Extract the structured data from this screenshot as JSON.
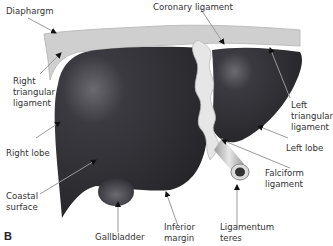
{
  "figure": {
    "panel_letter": "B",
    "colors": {
      "liver": "#2f2f34",
      "liver_highlight": "#5a5a60",
      "ligament": "#d9d9d9",
      "ligament_light": "#f0f0f0",
      "diaphragm": "#c4c4c4",
      "gallbladder": "#4a4a50",
      "arrow": "#999999",
      "arrowhead": "#111111",
      "text": "#333333"
    },
    "labels": [
      {
        "id": "diaphragm",
        "text": "Diaphargm"
      },
      {
        "id": "coronary-ligament",
        "text": "Coronary ligament"
      },
      {
        "id": "right-triangular-ligament",
        "text": "Right\ntriangular\nligament"
      },
      {
        "id": "left-triangular-ligament",
        "text": "Left\ntriangular\nligament"
      },
      {
        "id": "right-lobe",
        "text": "Right lobe"
      },
      {
        "id": "left-lobe",
        "text": "Left lobe"
      },
      {
        "id": "falciform-ligament",
        "text": "Falciform\nligament"
      },
      {
        "id": "coastal-surface",
        "text": "Coastal\nsurface"
      },
      {
        "id": "gallbladder",
        "text": "Gallbladder"
      },
      {
        "id": "inferior-margin",
        "text": "Inferior\nmargin"
      },
      {
        "id": "ligamentum-teres",
        "text": "Ligamentum\nteres"
      }
    ]
  }
}
